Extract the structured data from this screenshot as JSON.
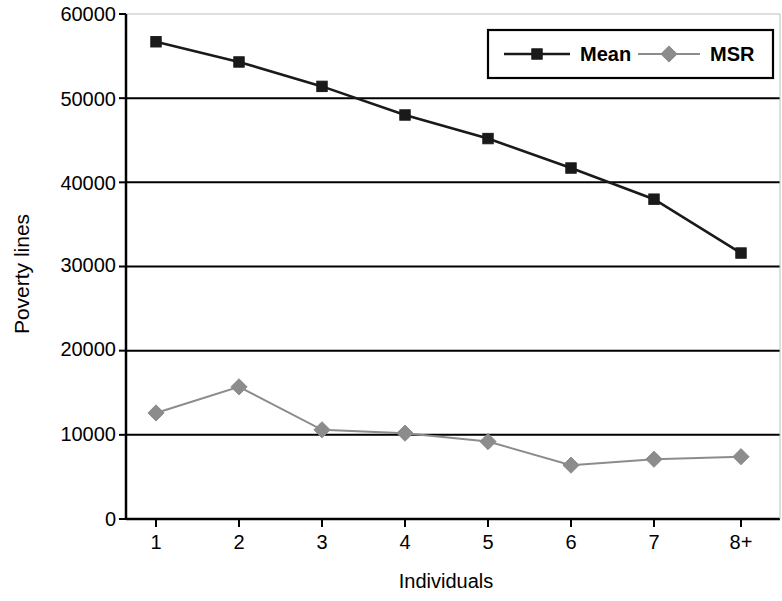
{
  "chart_data": {
    "type": "line",
    "title": "",
    "xlabel": "Individuals",
    "ylabel": "Poverty lines",
    "categories": [
      "1",
      "2",
      "3",
      "4",
      "5",
      "6",
      "7",
      "8+"
    ],
    "ylim": [
      0,
      60000
    ],
    "ytick_labels": [
      "60000",
      "50000",
      "40000",
      "30000",
      "20000",
      "10000",
      "0"
    ],
    "ytick_values": [
      60000,
      50000,
      40000,
      30000,
      20000,
      10000,
      0
    ],
    "grid": "horizontal",
    "legend_position": "top-right",
    "series": [
      {
        "name": "Mean",
        "color": "#1a1a1a",
        "marker": "square",
        "values": [
          56700,
          54300,
          51400,
          48000,
          45200,
          41700,
          38000,
          31600
        ]
      },
      {
        "name": "MSR",
        "color": "#8c8c8c",
        "marker": "diamond",
        "values": [
          12600,
          15700,
          10600,
          10200,
          9200,
          6400,
          7100,
          7400
        ]
      }
    ]
  },
  "legend": {
    "items": [
      {
        "label": "Mean",
        "color": "#1a1a1a",
        "marker": "square"
      },
      {
        "label": "MSR",
        "color": "#8c8c8c",
        "marker": "diamond"
      }
    ]
  },
  "axes": {
    "y_title": "Poverty lines",
    "x_title": "Individuals"
  }
}
